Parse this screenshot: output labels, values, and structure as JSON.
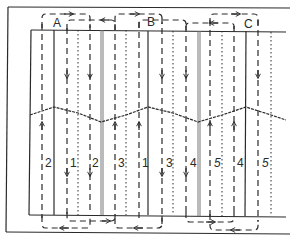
{
  "diagram": {
    "colors": {
      "line": "#2a2a2a",
      "background": "#ffffff",
      "double_line": "#888888"
    },
    "top_labels": [
      {
        "id": "A",
        "text": "A",
        "x": 57,
        "y": 26
      },
      {
        "id": "B",
        "text": "B",
        "x": 151,
        "y": 25
      },
      {
        "id": "C",
        "text": "C",
        "x": 248,
        "y": 27
      }
    ],
    "lane_numbers": [
      {
        "text": "2",
        "x": 47,
        "y": 165
      },
      {
        "text": "1",
        "x": 73,
        "y": 165
      },
      {
        "text": "2",
        "x": 94,
        "y": 165
      },
      {
        "text": "3",
        "x": 121,
        "y": 165
      },
      {
        "text": "1",
        "x": 144,
        "y": 165
      },
      {
        "text": "3",
        "x": 168,
        "y": 165
      },
      {
        "text": "4",
        "x": 192,
        "y": 165
      },
      {
        "text": "5",
        "x": 218,
        "y": 165
      },
      {
        "text": "4",
        "x": 240,
        "y": 165
      },
      {
        "text": "5",
        "x": 265,
        "y": 165
      }
    ]
  }
}
